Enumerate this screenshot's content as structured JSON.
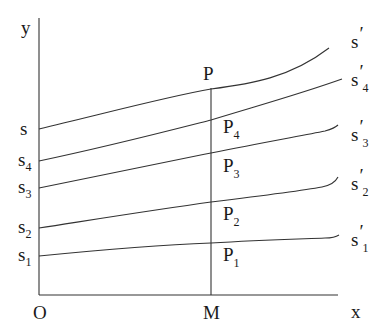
{
  "diagram": {
    "axes": {
      "y_label": "y",
      "x_label": "x",
      "origin_label": "O",
      "foot_label": "M",
      "color": "#333333"
    },
    "curves": [
      {
        "id": "s",
        "left_label": "s",
        "left_sub": "",
        "right_label": "s",
        "right_prime": "′",
        "right_sub": "",
        "point_label": "P",
        "point_sub": ""
      },
      {
        "id": "s4",
        "left_label": "s",
        "left_sub": "4",
        "right_label": "s",
        "right_prime": "′",
        "right_sub": "4",
        "point_label": "P",
        "point_sub": "4"
      },
      {
        "id": "s3",
        "left_label": "s",
        "left_sub": "3",
        "right_label": "s",
        "right_prime": "′",
        "right_sub": "3",
        "point_label": "P",
        "point_sub": "3"
      },
      {
        "id": "s2",
        "left_label": "s",
        "left_sub": "2",
        "right_label": "s",
        "right_prime": "′",
        "right_sub": "2",
        "point_label": "P",
        "point_sub": "2"
      },
      {
        "id": "s1",
        "left_label": "s",
        "left_sub": "1",
        "right_label": "s",
        "right_prime": "′",
        "right_sub": "1",
        "point_label": "P",
        "point_sub": "1"
      }
    ]
  }
}
